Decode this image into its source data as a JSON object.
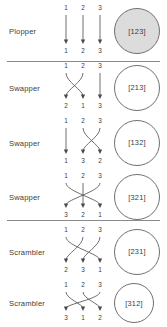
{
  "figure": {
    "type": "permutation-braid-table",
    "strand_count": 3,
    "row_count": 6,
    "group_separators_after_rows": [
      0,
      3
    ],
    "rows": [
      {
        "label": "Plopper",
        "top_labels": [
          "1",
          "2",
          "3"
        ],
        "bottom_labels": [
          "1",
          "2",
          "3"
        ],
        "permutation": [
          1,
          2,
          3
        ],
        "circle_text": "[123]",
        "circle_filled": true,
        "circle_fill_color": "#dcdcdc",
        "circle_stroke_color": "#707070"
      },
      {
        "label": "Swapper",
        "top_labels": [
          "1",
          "2",
          "3"
        ],
        "bottom_labels": [
          "2",
          "1",
          "3"
        ],
        "permutation": [
          2,
          1,
          3
        ],
        "circle_text": "[213]",
        "circle_filled": false,
        "circle_fill_color": "#ffffff",
        "circle_stroke_color": "#707070"
      },
      {
        "label": "Swapper",
        "top_labels": [
          "1",
          "2",
          "3"
        ],
        "bottom_labels": [
          "1",
          "3",
          "2"
        ],
        "permutation": [
          1,
          3,
          2
        ],
        "circle_text": "[132]",
        "circle_filled": false,
        "circle_fill_color": "#ffffff",
        "circle_stroke_color": "#707070"
      },
      {
        "label": "Swapper",
        "top_labels": [
          "1",
          "2",
          "3"
        ],
        "bottom_labels": [
          "3",
          "2",
          "1"
        ],
        "permutation": [
          3,
          2,
          1
        ],
        "circle_text": "[321]",
        "circle_filled": false,
        "circle_fill_color": "#ffffff",
        "circle_stroke_color": "#707070"
      },
      {
        "label": "Scrambler",
        "top_labels": [
          "1",
          "2",
          "3"
        ],
        "bottom_labels": [
          "2",
          "3",
          "1"
        ],
        "permutation": [
          2,
          3,
          1
        ],
        "circle_text": "[231]",
        "circle_filled": false,
        "circle_fill_color": "#ffffff",
        "circle_stroke_color": "#707070"
      },
      {
        "label": "Scrambler",
        "top_labels": [
          "1",
          "2",
          "3"
        ],
        "bottom_labels": [
          "3",
          "1",
          "2"
        ],
        "permutation": [
          3,
          1,
          2
        ],
        "circle_text": "[312]",
        "circle_filled": false,
        "circle_fill_color": "#ffffff",
        "circle_stroke_color": "#707070"
      }
    ],
    "colors": {
      "strand": "#4a4a4a",
      "text": "#3a3a3a",
      "separator": "#8a8a8a",
      "background": "#ffffff"
    }
  }
}
